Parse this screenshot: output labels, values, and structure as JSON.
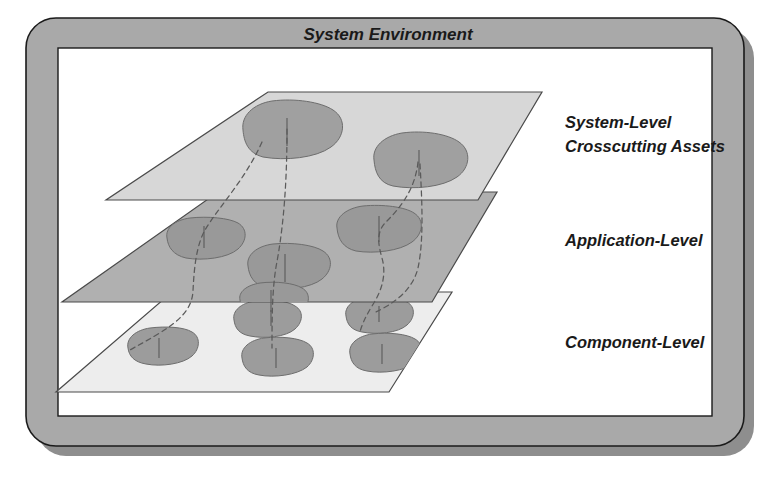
{
  "diagram": {
    "title": "System Environment",
    "type": "layered-plane-diagram",
    "frame": {
      "style": "rounded-bezel-with-drop-shadow",
      "bezel_color": "#a9a9a9",
      "shadow_color": "#8e8e8e",
      "stroke_color": "#1a1a1a",
      "panel_color": "#ffffff"
    },
    "layers": [
      {
        "id": "system-level",
        "label": "System-Level",
        "label_line2": "Crosscutting Assets",
        "label_lines": [
          "System-Level",
          "Crosscutting Assets"
        ],
        "plane_color": "#d7d7d7",
        "asset_color": "#a0a0a0",
        "asset_count": 2,
        "order": 1
      },
      {
        "id": "application-level",
        "label": "Application-Level",
        "label_lines": [
          "Application-Level"
        ],
        "plane_color": "#b0b0b0",
        "asset_color": "#999999",
        "asset_count": 4,
        "order": 2
      },
      {
        "id": "component-level",
        "label": "Component-Level",
        "label_lines": [
          "Component-Level"
        ],
        "plane_color": "#ededed",
        "asset_color": "#9c9c9c",
        "asset_count": 5,
        "order": 3
      }
    ],
    "connectors": {
      "style": "dashed",
      "color": "#5a5a5a",
      "count": 4,
      "description": "dashed traces linking crosscutting assets down through the layers"
    },
    "colors": {
      "plane_stroke": "#4a4a4a",
      "asset_stroke": "#6d6d6d",
      "text": "#1a1a1a"
    }
  }
}
